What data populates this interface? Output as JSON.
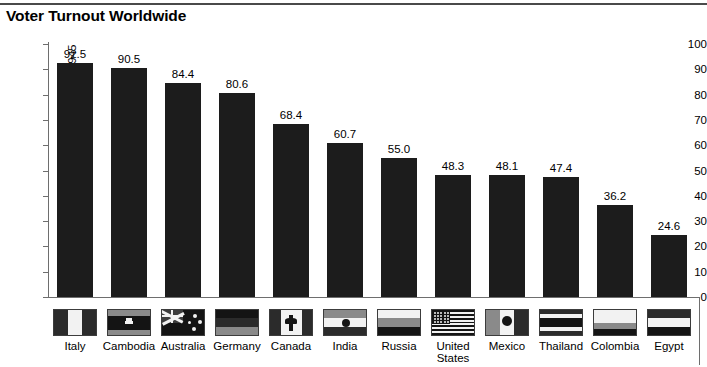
{
  "chart_title": "Voter Turnout Worldwide",
  "chart_data": {
    "type": "bar",
    "title": "Voter Turnout Worldwide",
    "xlabel": "",
    "ylabel": "Turnout at all parliamentary elections since 1945",
    "ylim": [
      0,
      100
    ],
    "yticks": [
      "0",
      "10",
      "20",
      "30",
      "40",
      "50",
      "60",
      "70",
      "80",
      "90",
      "100"
    ],
    "grid": false,
    "legend": "none",
    "categories": [
      "Italy",
      "Cambodia",
      "Australia",
      "Germany",
      "Canada",
      "India",
      "Russia",
      "United States",
      "Mexico",
      "Thailand",
      "Colombia",
      "Egypt"
    ],
    "values": [
      92.5,
      90.5,
      84.4,
      80.6,
      68.4,
      60.7,
      55.0,
      48.3,
      48.1,
      47.4,
      36.2,
      24.6
    ],
    "value_labels": [
      "92.5",
      "90.5",
      "84.4",
      "80.6",
      "68.4",
      "60.7",
      "55.0",
      "48.3",
      "48.1",
      "47.4",
      "36.2",
      "24.6"
    ],
    "bar_color": "#1c1c1c",
    "axis_color": "#6e6e6e",
    "background": "#ffffff"
  },
  "categories": [
    {
      "label": "Italy",
      "value_label": "92.5",
      "flag": "flag-italy"
    },
    {
      "label": "Cambodia",
      "value_label": "90.5",
      "flag": "flag-cambodia"
    },
    {
      "label": "Australia",
      "value_label": "84.4",
      "flag": "flag-australia"
    },
    {
      "label": "Germany",
      "value_label": "80.6",
      "flag": "flag-germany"
    },
    {
      "label": "Canada",
      "value_label": "68.4",
      "flag": "flag-canada"
    },
    {
      "label": "India",
      "value_label": "60.7",
      "flag": "flag-india"
    },
    {
      "label": "Russia",
      "value_label": "55.0",
      "flag": "flag-russia"
    },
    {
      "label": "United\nStates",
      "value_label": "48.3",
      "flag": "flag-united-states"
    },
    {
      "label": "Mexico",
      "value_label": "48.1",
      "flag": "flag-mexico"
    },
    {
      "label": "Thailand",
      "value_label": "47.4",
      "flag": "flag-thailand"
    },
    {
      "label": "Colombia",
      "value_label": "36.2",
      "flag": "flag-colombia"
    },
    {
      "label": "Egypt",
      "value_label": "24.6",
      "flag": "flag-egypt"
    }
  ]
}
